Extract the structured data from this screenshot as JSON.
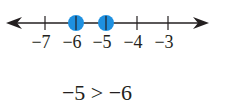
{
  "number_line": {
    "ticks": [
      {
        "value": -7,
        "label": "−7",
        "x": 45
      },
      {
        "value": -6,
        "label": "−6",
        "x": 76
      },
      {
        "value": -5,
        "label": "−5",
        "x": 106
      },
      {
        "value": -4,
        "label": "−4",
        "x": 137
      },
      {
        "value": -3,
        "label": "−3",
        "x": 168
      }
    ],
    "points": [
      {
        "value": -6,
        "x": 76
      },
      {
        "value": -5,
        "x": 106
      }
    ],
    "point_color": "#1e90e0",
    "line_color": "#231f20",
    "arrows": [
      "left-arrow-icon",
      "right-arrow-icon"
    ]
  },
  "inequality": "−5 > −6"
}
